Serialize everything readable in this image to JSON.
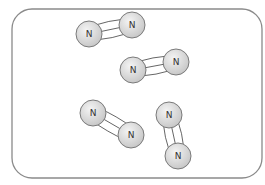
{
  "diagram": {
    "container": {
      "x": 12,
      "y": 9,
      "width": 250,
      "height": 169,
      "radius": 20
    },
    "atom_radius": 13,
    "colors": {
      "atom_fill_light": "#f4f4f4",
      "atom_fill_dark": "#c8c8c8",
      "stroke": "#7a7a7a",
      "text": "#333333",
      "frame": "#8a8a8a"
    },
    "molecules": [
      {
        "id": "n2-1",
        "bond": "triple",
        "atoms": [
          {
            "label": "N",
            "x": 89,
            "y": 34
          },
          {
            "label": "N",
            "x": 132,
            "y": 25
          }
        ]
      },
      {
        "id": "n2-2",
        "bond": "triple",
        "atoms": [
          {
            "label": "N",
            "x": 133,
            "y": 70
          },
          {
            "label": "N",
            "x": 176,
            "y": 62
          }
        ]
      },
      {
        "id": "n2-3",
        "bond": "triple",
        "atoms": [
          {
            "label": "N",
            "x": 93,
            "y": 113
          },
          {
            "label": "N",
            "x": 131,
            "y": 135
          }
        ]
      },
      {
        "id": "n2-4",
        "bond": "triple",
        "atoms": [
          {
            "label": "N",
            "x": 169,
            "y": 115
          },
          {
            "label": "N",
            "x": 178,
            "y": 156
          }
        ]
      }
    ]
  }
}
